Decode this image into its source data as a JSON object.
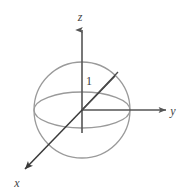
{
  "figure": {
    "background_color": "#ffffff",
    "width": 186,
    "height": 193,
    "origin": {
      "x": 82,
      "y": 110
    },
    "colors": {
      "sphere_outline": "#9a9a9a",
      "equator": "#9a9a9a",
      "axis": "#555555",
      "radius_line": "#4a4a4a",
      "label": "#444444"
    },
    "sphere": {
      "center_x": 82,
      "center_y": 110,
      "radius": 48,
      "equator_ry": 18
    },
    "axes": [
      {
        "name": "z-axis",
        "label": "z",
        "label_x": 80,
        "label_y": 21,
        "from_x": 82,
        "from_y": 110,
        "to_x": 82,
        "to_y": 28,
        "direction": "up"
      },
      {
        "name": "y-axis",
        "label": "y",
        "label_x": 173,
        "label_y": 115,
        "from_x": 82,
        "from_y": 110,
        "to_x": 168,
        "to_y": 110,
        "direction": "right"
      },
      {
        "name": "x-axis",
        "label": "x",
        "label_x": 17,
        "label_y": 187,
        "from_x": 82,
        "from_y": 110,
        "to_x": 22,
        "to_y": 172,
        "direction": "down-left"
      }
    ],
    "radius": {
      "name": "unit-radius",
      "label": "1",
      "label_x": 89,
      "label_y": 85,
      "from_x": 82,
      "from_y": 110,
      "to_x": 118,
      "to_y": 72
    }
  }
}
